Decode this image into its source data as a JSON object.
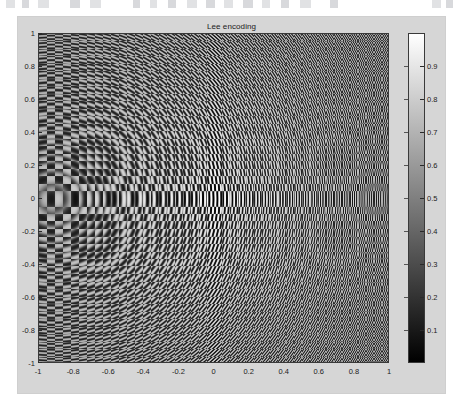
{
  "window": {
    "background_color": "#ffffff",
    "figure_background_color": "#d6d6d6"
  },
  "toolbar": {
    "visible": "partially-cropped",
    "icons": [
      "new-figure-icon",
      "open-icon",
      "save-icon",
      "print-icon",
      "zoom-in-icon",
      "zoom-out-icon",
      "pan-icon",
      "rotate-icon",
      "data-cursor-icon",
      "brush-icon",
      "link-icon",
      "colorbar-icon",
      "legend-icon",
      "hide-plot-tools-icon",
      "dock-icon"
    ]
  },
  "plot": {
    "title": "Lee encoding",
    "type": "heatmap",
    "colormap": "gray",
    "axis_color": "#3a3a3a"
  },
  "chart_data": {
    "type": "heatmap",
    "title": "Lee encoding",
    "xlabel": "",
    "ylabel": "",
    "xlim": [
      -1,
      1
    ],
    "ylim": [
      -1,
      1
    ],
    "clim": [
      0,
      1
    ],
    "grid": false,
    "legend": "colorbar-right",
    "colormap": "gray",
    "xticks": [
      "-1",
      "-0.8",
      "-0.6",
      "-0.4",
      "-0.2",
      "0",
      "0.2",
      "0.4",
      "0.6",
      "0.8",
      "1"
    ],
    "xtick_values": [
      -1,
      -0.8,
      -0.6,
      -0.4,
      -0.2,
      0,
      0.2,
      0.4,
      0.6,
      0.8,
      1
    ],
    "yticks": [
      "1",
      "0.8",
      "0.6",
      "0.4",
      "0.2",
      "0",
      "-0.2",
      "-0.4",
      "-0.6",
      "-0.8",
      "-1"
    ],
    "ytick_values": [
      1,
      0.8,
      0.6,
      0.4,
      0.2,
      0,
      -0.2,
      -0.4,
      -0.6,
      -0.8,
      -1
    ],
    "colorbar_ticks": [
      "0.1",
      "0.2",
      "0.3",
      "0.4",
      "0.5",
      "0.6",
      "0.7",
      "0.8",
      "0.9"
    ],
    "colorbar_tick_values": [
      0.1,
      0.2,
      0.3,
      0.4,
      0.5,
      0.6,
      0.7,
      0.8,
      0.9
    ],
    "carrier_period_px": 4,
    "carrier_orientation": "vertical",
    "field_symmetry": "radial-quadratic-phase",
    "center": [
      0,
      0
    ],
    "value_range": [
      0,
      1
    ]
  }
}
